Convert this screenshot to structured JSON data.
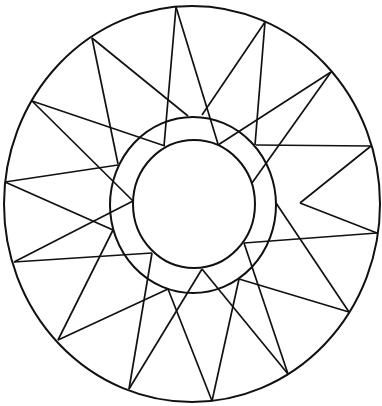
{
  "figure": {
    "stroke_color": "#111111",
    "background_color": "#ffffff",
    "outer_circle": {
      "cx": 192,
      "cy": 204,
      "rx": 188,
      "ry": 198
    },
    "middle_circle": {
      "cx": 193,
      "cy": 205,
      "rx": 83,
      "ry": 88
    },
    "inner_circle": {
      "cx": 194,
      "cy": 204,
      "rx": 61,
      "ry": 64
    },
    "segments": [
      [
        176,
        7,
        164,
        146
      ],
      [
        176,
        7,
        218,
        144
      ],
      [
        92,
        38,
        118,
        164
      ],
      [
        92,
        38,
        188,
        116
      ],
      [
        265,
        22,
        202,
        115
      ],
      [
        265,
        22,
        255,
        145
      ],
      [
        331,
        72,
        218,
        145
      ],
      [
        331,
        72,
        252,
        183
      ],
      [
        371,
        146,
        256,
        145
      ],
      [
        371,
        146,
        300,
        203
      ],
      [
        377,
        233,
        300,
        203
      ],
      [
        377,
        233,
        244,
        243
      ],
      [
        349,
        312,
        276,
        203
      ],
      [
        349,
        312,
        239,
        279
      ],
      [
        288,
        374,
        244,
        243
      ],
      [
        288,
        374,
        202,
        269
      ],
      [
        212,
        401,
        239,
        279
      ],
      [
        212,
        401,
        168,
        289
      ],
      [
        129,
        389,
        202,
        269
      ],
      [
        129,
        389,
        152,
        253
      ],
      [
        58,
        340,
        168,
        289
      ],
      [
        58,
        340,
        113,
        230
      ],
      [
        14,
        262,
        152,
        253
      ],
      [
        14,
        262,
        133,
        201
      ],
      [
        5,
        182,
        113,
        230
      ],
      [
        5,
        182,
        118,
        165
      ],
      [
        32,
        101,
        133,
        201
      ],
      [
        32,
        101,
        165,
        146
      ]
    ]
  }
}
